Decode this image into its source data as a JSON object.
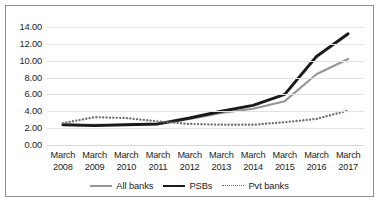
{
  "chart_data": {
    "type": "line",
    "title": "",
    "subtitle": "",
    "xlabel": "",
    "ylabel": "",
    "categories": [
      "March 2008",
      "March 2009",
      "March 2010",
      "March 2011",
      "March 2012",
      "March 2013",
      "March 2014",
      "March 2015",
      "March 2016",
      "March 2017"
    ],
    "category_lines": [
      [
        "March",
        "2008"
      ],
      [
        "March",
        "2009"
      ],
      [
        "March",
        "2010"
      ],
      [
        "March",
        "2011"
      ],
      [
        "March",
        "2012"
      ],
      [
        "March",
        "2013"
      ],
      [
        "March",
        "2014"
      ],
      [
        "March",
        "2015"
      ],
      [
        "March",
        "2016"
      ],
      [
        "March",
        "2017"
      ]
    ],
    "ylim": [
      0,
      14
    ],
    "ytick_step": 2,
    "ytick_labels": [
      "14.00",
      "12.00",
      "10.00",
      "8.00",
      "6.00",
      "4.00",
      "2.00",
      "0.00"
    ],
    "ytick_values": [
      14,
      12,
      10,
      8,
      6,
      4,
      2,
      0
    ],
    "grid": "horizontal",
    "legend_position": "bottom",
    "series": [
      {
        "name": "All banks",
        "style": "solid",
        "color": "#959595",
        "width": 2.1,
        "values": [
          2.4,
          2.4,
          2.4,
          2.5,
          3.1,
          3.8,
          4.3,
          5.2,
          8.4,
          10.2
        ]
      },
      {
        "name": "PSBs",
        "style": "solid",
        "color": "#1a1a1a",
        "width": 2.9,
        "values": [
          2.4,
          2.3,
          2.4,
          2.5,
          3.2,
          4.0,
          4.7,
          6.0,
          10.5,
          13.2
        ]
      },
      {
        "name": "Pvt banks",
        "style": "dotted",
        "color": "#6d6d6d",
        "width": 1.9,
        "values": [
          2.6,
          3.3,
          3.2,
          2.8,
          2.5,
          2.4,
          2.4,
          2.7,
          3.1,
          4.1
        ]
      }
    ]
  },
  "legend": {
    "items": [
      {
        "label": "All banks"
      },
      {
        "label": "PSBs"
      },
      {
        "label": "Pvt banks"
      }
    ]
  },
  "colors": {
    "all_banks": "#959595",
    "psbs": "#1a1a1a",
    "pvt_banks": "#6d6d6d",
    "gridline": "#e2e2e2",
    "border": "#8e8e8e",
    "background": "#ffffff",
    "text": "#1d1d1d"
  }
}
